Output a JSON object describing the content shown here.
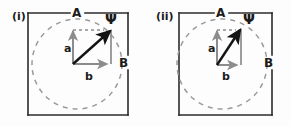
{
  "figure": {
    "panels": [
      {
        "tag": "(i)",
        "tag_pos": {
          "x": 12,
          "y": 11
        },
        "box": {
          "x": 28,
          "y": 13,
          "w": 100,
          "h": 102
        },
        "circle": {
          "cx": 77,
          "cy": 64,
          "r": 45
        },
        "labels": {
          "top": "A",
          "top_pos": {
            "x": 72,
            "y": 7
          },
          "right": "B",
          "right_pos": {
            "x": 119,
            "y": 57
          },
          "psi": "Ψ",
          "psi_pos": {
            "x": 105,
            "y": 12
          },
          "a": "a",
          "a_pos": {
            "x": 64,
            "y": 43
          },
          "b": "b",
          "b_pos": {
            "x": 85,
            "y": 71
          }
        },
        "vectors": {
          "origin": {
            "x": 73,
            "y": 64
          },
          "a_tip": {
            "x": 73,
            "y": 30
          },
          "b_tip": {
            "x": 108,
            "y": 64
          },
          "resultant_tip": {
            "x": 110,
            "y": 30
          }
        }
      },
      {
        "tag": "(ii)",
        "tag_pos": {
          "x": 156,
          "y": 11
        },
        "box": {
          "x": 179,
          "y": 13,
          "w": 93,
          "h": 102
        },
        "circle": {
          "cx": 222,
          "cy": 64,
          "r": 45
        },
        "labels": {
          "top": "A",
          "top_pos": {
            "x": 216,
            "y": 7
          },
          "right": "B",
          "right_pos": {
            "x": 264,
            "y": 57
          },
          "psi": "Ψ",
          "psi_pos": {
            "x": 243,
            "y": 12
          },
          "a": "a",
          "a_pos": {
            "x": 208,
            "y": 43
          },
          "b": "b",
          "b_pos": {
            "x": 222,
            "y": 71
          }
        },
        "vectors": {
          "origin": {
            "x": 217,
            "y": 65
          },
          "a_tip": {
            "x": 217,
            "y": 30
          },
          "b_tip": {
            "x": 238,
            "y": 65
          },
          "resultant_tip": {
            "x": 240,
            "y": 29
          }
        }
      }
    ],
    "colors": {
      "box_stroke": "#2b2b2b",
      "circle_stroke": "#9a9a9a",
      "component_vector": "#8c8c8c",
      "resultant_vector": "#141414",
      "text": "#1b1b1b",
      "background": "#fdfdfd"
    },
    "meta": {
      "description": "Two panel vector-addition diagram: components a and b sum to resultant Psi on a dashed circle",
      "resultant_symbol": "Ψ",
      "component_names": [
        "a",
        "b"
      ],
      "axis_names": [
        "A",
        "B"
      ]
    }
  }
}
